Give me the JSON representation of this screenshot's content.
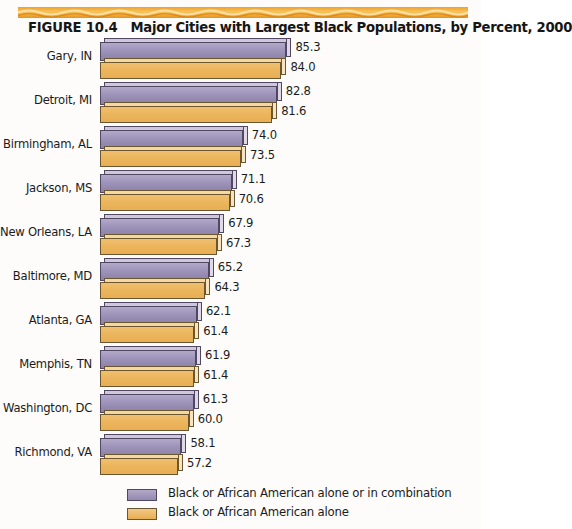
{
  "figure": {
    "label": "FIGURE 10.4",
    "title": "Major Cities with Largest Black Populations, by Percent, 2000"
  },
  "legend": {
    "items": [
      {
        "name": "legend-swatch-combination",
        "label": "Black or African American alone or in combination",
        "color": "#9d93b5"
      },
      {
        "name": "legend-swatch-alone",
        "label": "Black or African American alone",
        "color": "#e8bd7a"
      }
    ]
  },
  "chart_data": {
    "type": "bar",
    "orientation": "horizontal",
    "title": "Major Cities with Largest Black Populations, by Percent, 2000",
    "xlabel": "",
    "ylabel": "",
    "grid": false,
    "legend_position": "bottom",
    "axis_visible": false,
    "value_format": "percent",
    "categories": [
      "Gary, IN",
      "Detroit, MI",
      "Birmingham, AL",
      "Jackson, MS",
      "New Orleans, LA",
      "Baltimore, MD",
      "Atlanta, GA",
      "Memphis, TN",
      "Washington, DC",
      "Richmond, VA"
    ],
    "series": [
      {
        "name": "Black or African American alone or in combination",
        "color": "#9d93b5",
        "values": [
          85.3,
          82.8,
          74.0,
          71.1,
          67.9,
          65.2,
          62.1,
          61.9,
          61.3,
          58.1
        ],
        "labels": [
          "85.3",
          "82.8",
          "74.0",
          "71.1",
          "67.9",
          "65.2",
          "62.1",
          "61.9",
          "61.3",
          "58.1"
        ]
      },
      {
        "name": "Black or African American alone",
        "color": "#e8bd7a",
        "values": [
          84.0,
          81.6,
          73.5,
          70.6,
          67.3,
          64.3,
          61.4,
          61.4,
          60.0,
          57.2
        ],
        "labels": [
          "84.0",
          "81.6",
          "73.5",
          "70.6",
          "67.3",
          "64.3",
          "61.4",
          "61.4",
          "60.0",
          "57.2"
        ]
      }
    ],
    "xlim": [
      37,
      88
    ]
  }
}
